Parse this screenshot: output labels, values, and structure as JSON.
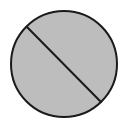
{
  "figure": {
    "type": "circle-with-diagonal-line",
    "shape": "circle",
    "fill_color": "#bdbdbd",
    "stroke_color": "#1a1a1a",
    "background_color": "#ffffff",
    "circle": {
      "cx": 64,
      "cy": 64,
      "r": 53,
      "stroke_width": 2
    },
    "line": {
      "x1": 27,
      "y1": 27,
      "x2": 101,
      "y2": 102,
      "stroke_width": 2
    }
  }
}
